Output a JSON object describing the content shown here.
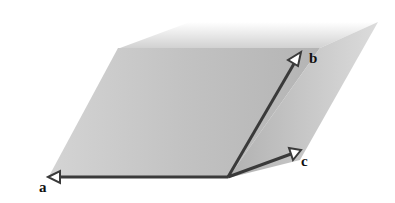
{
  "diagram": {
    "vectors": [
      {
        "label": "a"
      },
      {
        "label": "b"
      },
      {
        "label": "c"
      }
    ],
    "colors": {
      "plane": "#b8b8b8",
      "arrow": "#3a3a3a",
      "background": "#ffffff"
    }
  }
}
